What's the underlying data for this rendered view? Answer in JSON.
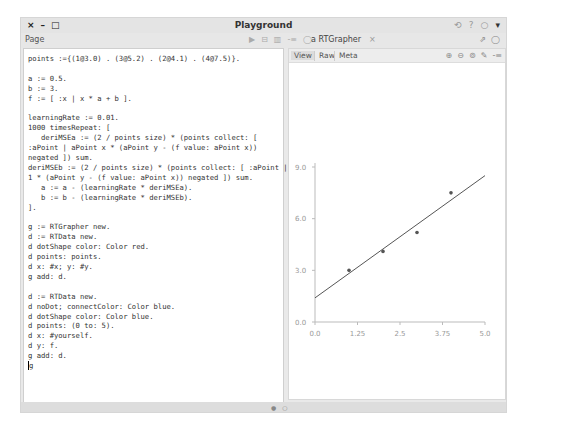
{
  "window": {
    "title": "Playground",
    "controls": {
      "close": "×",
      "minimize": "–",
      "maximize": "□"
    },
    "title_right_icons": [
      "⟲",
      "?",
      "○",
      "▾"
    ]
  },
  "toolbar": {
    "page_label": "Page",
    "code_tools": [
      "▶",
      "⊟",
      "▥",
      "-≡",
      "◯"
    ],
    "graph_tab": {
      "label": "a RTGrapher",
      "close": "×"
    },
    "graph_tools": [
      "⇗",
      "◯"
    ]
  },
  "code": {
    "lines": [
      "points :={(1@3.0) . (3@5.2) . (2@4.1) . (4@7.5)}.",
      "",
      "a := 0.5.",
      "b := 3.",
      "f := [ :x | x * a + b ].",
      "",
      "learningRate := 0.01.",
      "1000 timesRepeat: [",
      "   deriMSEa := (2 / points size) * (points collect: [",
      ":aPoint | aPoint x * (aPoint y - (f value: aPoint x))",
      "negated ]) sum.",
      "deriMSEb := (2 / points size) * (points collect: [ :aPoint |",
      "1 * (aPoint y - (f value: aPoint x)) negated ]) sum.",
      "   a := a - (learningRate * deriMSEa).",
      "   b := b - (learningRate * deriMSEb).",
      "].",
      "",
      "g := RTGrapher new.",
      "d := RTData new.",
      "d dotShape color: Color red.",
      "d points: points.",
      "d x: #x; y: #y.",
      "g add: d.",
      "",
      "d := RTData new.",
      "d noDot; connectColor: Color blue.",
      "d dotShape color: Color blue.",
      "d points: (0 to: 5).",
      "d x: #yourself.",
      "d y: f.",
      "g add: d.",
      "g"
    ]
  },
  "graph_panel": {
    "tabs": [
      {
        "label": "View",
        "active": true
      },
      {
        "label": "Raw",
        "active": false
      },
      {
        "label": "Meta",
        "active": false
      }
    ],
    "zoom_tools": [
      "⊕",
      "⊖",
      "⊚",
      "✎",
      "-≡"
    ]
  },
  "chart_data": {
    "type": "scatter",
    "title": "",
    "xlabel": "",
    "ylabel": "",
    "xlim": [
      0.0,
      5.0
    ],
    "ylim": [
      0.0,
      9.0
    ],
    "x_ticks": [
      "0.0",
      "1.25",
      "2.5",
      "3.75",
      "5.0"
    ],
    "y_ticks": [
      "0.0",
      "3.0",
      "6.0",
      "9.0"
    ],
    "grid": false,
    "series": [
      {
        "name": "points",
        "kind": "scatter",
        "x": [
          1,
          2,
          3,
          4
        ],
        "y": [
          3.0,
          4.1,
          5.2,
          7.5
        ]
      },
      {
        "name": "f (fitted line)",
        "kind": "line",
        "x": [
          0,
          5
        ],
        "y": [
          1.4,
          8.5
        ]
      }
    ]
  },
  "statusbar": {
    "dots": [
      "●",
      "○"
    ]
  }
}
